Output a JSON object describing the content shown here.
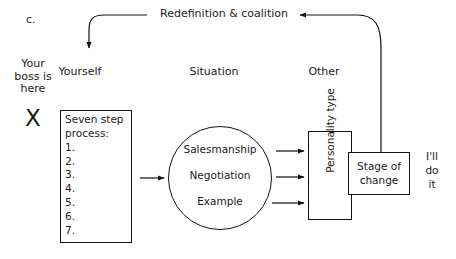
{
  "figure": {
    "panel_label": "c.",
    "title_flow": "Redefinition & coalition"
  },
  "columns": [
    {
      "id": "yourself",
      "label": "Yourself"
    },
    {
      "id": "situation",
      "label": "Situation"
    },
    {
      "id": "other",
      "label": "Other"
    }
  ],
  "boss_annotation": {
    "text": "Your\nboss is\nhere",
    "marker": "X"
  },
  "seven_step": {
    "heading": "Seven step\nprocess:",
    "items": [
      "1.",
      "2.",
      "3.",
      "4.",
      "5.",
      "6.",
      "7."
    ]
  },
  "situation_circle": {
    "items": [
      "Salesmanship",
      "Negotiation",
      "Example"
    ]
  },
  "other_nodes": {
    "personality_type": "Personality\ntype",
    "stage_of_change": "Stage of\nchange"
  },
  "outcome": {
    "text": "I'll\ndo\nit"
  },
  "colors": {
    "ink": "#1a1a1a",
    "stroke": "#111111",
    "background": "#ffffff"
  }
}
